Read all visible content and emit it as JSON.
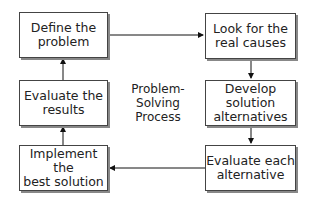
{
  "diagram": {
    "title": "Problem-\nSolving\nProcess",
    "steps": [
      {
        "id": "define",
        "label": "Define the\nproblem"
      },
      {
        "id": "look",
        "label": "Look for the\nreal causes"
      },
      {
        "id": "develop",
        "label": "Develop\nsolution\nalternatives"
      },
      {
        "id": "evaluate_each",
        "label": "Evaluate each\nalternative"
      },
      {
        "id": "implement",
        "label": "Implement the\nbest solution"
      },
      {
        "id": "evaluate_results",
        "label": "Evaluate the\nresults"
      }
    ],
    "flow": [
      "define",
      "look",
      "develop",
      "evaluate_each",
      "implement",
      "evaluate_results",
      "define"
    ],
    "colors": {
      "border": "#444444",
      "shadow": "#888888",
      "arrow": "#111111"
    }
  }
}
